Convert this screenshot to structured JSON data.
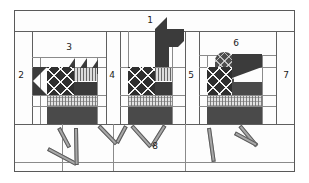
{
  "figure": {
    "type": "quilt-block-piecing-diagram",
    "width": 309,
    "height": 183,
    "background_color": "#ffffff",
    "frame_color": "#595959",
    "piece_line_color": "#8a8a8a"
  },
  "callouts": [
    {
      "id": "1",
      "label": "1",
      "x": 150,
      "y": 21,
      "role": "top-border-strip"
    },
    {
      "id": "2",
      "label": "2",
      "x": 21,
      "y": 75,
      "role": "left-border-strip"
    },
    {
      "id": "3",
      "label": "3",
      "x": 69,
      "y": 47,
      "role": "first-bird-sky-strip"
    },
    {
      "id": "4",
      "label": "4",
      "x": 112,
      "y": 75,
      "role": "first-sashing-strip"
    },
    {
      "id": "5",
      "label": "5",
      "x": 191,
      "y": 75,
      "role": "second-sashing-strip"
    },
    {
      "id": "6",
      "label": "6",
      "x": 236,
      "y": 43,
      "role": "third-bird-sky-strip"
    },
    {
      "id": "7",
      "label": "7",
      "x": 286,
      "y": 75,
      "role": "right-border-strip"
    },
    {
      "id": "8",
      "label": "8",
      "x": 155,
      "y": 147,
      "role": "bottom-border-strip"
    }
  ],
  "fabrics": [
    {
      "name": "solid-dark",
      "color": "#3b3b3b",
      "description": "solid dark"
    },
    {
      "name": "solid-mid-dark",
      "color": "#4a4a4a",
      "description": "solid medium dark"
    },
    {
      "name": "x-print-dark",
      "color": "#2f2f2f",
      "description": "dark print with white X motifs"
    },
    {
      "name": "diamond-print",
      "color": "#4d4d4d",
      "description": "dark print with light diamond grid"
    },
    {
      "name": "plaid-light",
      "color": "#e2e2e2",
      "description": "light plaid / gingham"
    },
    {
      "name": "stripe-light",
      "color": "#dcdcdc",
      "description": "light vertical stripe"
    },
    {
      "name": "background-white",
      "color": "#ffffff",
      "description": "white background"
    },
    {
      "name": "leg-grey",
      "color": "#a8a8a8",
      "description": "grey leg strip"
    }
  ],
  "birds": [
    {
      "id": "bird-1",
      "position": "left",
      "head": "solid-dark-with-beak",
      "neck": "short",
      "tail": "sawtooth-triangles",
      "body": "x-print-dark",
      "breast": "stripe-light",
      "lower_body": "plaid-light"
    },
    {
      "id": "bird-2",
      "position": "center",
      "head": "solid-dark-with-beak",
      "neck": "tall-solid-dark",
      "tail": "none",
      "body": "x-print-dark",
      "breast": "stripe-light",
      "lower_body": "plaid-light"
    },
    {
      "id": "bird-3",
      "position": "right",
      "head": "solid-dark-with-beak",
      "neck": "tall-diamond-print",
      "tail": "none",
      "body": "x-print-dark",
      "breast": "solid-mid-dark",
      "lower_body": "plaid-light"
    }
  ],
  "legs": {
    "count": 6,
    "color": "#a8a8a8",
    "outline": "#5a5a5a",
    "style": "bent-stick"
  }
}
